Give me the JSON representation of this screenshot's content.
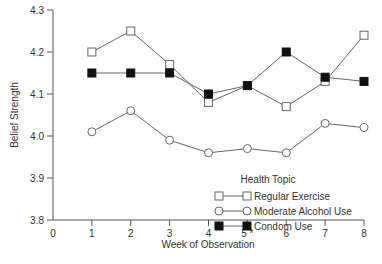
{
  "chart_data": {
    "type": "line",
    "title": "",
    "xlabel": "Week of Observation",
    "ylabel": "Belief Strength",
    "x": [
      1,
      2,
      3,
      4,
      5,
      6,
      7,
      8
    ],
    "xticks": [
      "0",
      "1",
      "2",
      "3",
      "4",
      "5 *",
      "6",
      "7",
      "8"
    ],
    "yticks": [
      "3.8",
      "3.9",
      "4.0",
      "4.1",
      "4.2",
      "4.3"
    ],
    "xlim": [
      0,
      8
    ],
    "ylim": [
      3.8,
      4.3
    ],
    "grid": false,
    "legend_title": "Health Topic",
    "legend_position": "lower right inside",
    "series": [
      {
        "name": "Regular Exercise",
        "marker": "open-square",
        "values": [
          4.2,
          4.25,
          4.17,
          4.08,
          4.12,
          4.07,
          4.13,
          4.24
        ]
      },
      {
        "name": "Moderate Alcohol Use",
        "marker": "open-circle",
        "values": [
          4.01,
          4.06,
          3.99,
          3.96,
          3.97,
          3.96,
          4.03,
          4.02
        ]
      },
      {
        "name": "Condom Use",
        "marker": "filled-square",
        "values": [
          4.15,
          4.15,
          4.15,
          4.1,
          4.12,
          4.2,
          4.14,
          4.13
        ]
      }
    ]
  },
  "colors": {
    "axis": "#555555",
    "line": "#666666",
    "marker_fill_dark": "#111111",
    "text": "#333333"
  }
}
